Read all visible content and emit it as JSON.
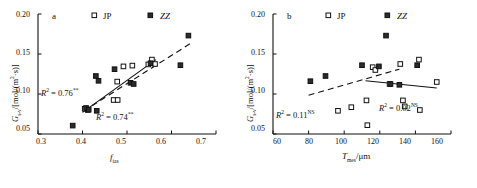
{
  "figure": {
    "background": "#ffffff",
    "ink": "#111111"
  },
  "chart_data": [
    {
      "type": "scatter",
      "panel": "a",
      "title": "",
      "xlabel": "f_ias",
      "ylabel": "G_s-v/[mol/(m2·s)]",
      "xlim": [
        0.3,
        0.7
      ],
      "ylim": [
        0.05,
        0.2
      ],
      "xticks": [
        0.3,
        0.4,
        0.5,
        0.6,
        0.7
      ],
      "xtick_labels": [
        "0.3",
        "0.4",
        "0.5",
        "0.6",
        "0.7"
      ],
      "yticks": [
        0.05,
        0.1,
        0.15,
        0.2
      ],
      "ytick_labels": [
        "0.05",
        "0.10",
        "0.15",
        "0.20"
      ],
      "grid": false,
      "legend_position": "top",
      "series": [
        {
          "name": "JP",
          "marker": "open-square",
          "points": [
            [
              0.405,
              0.0815
            ],
            [
              0.412,
              0.08
            ],
            [
              0.47,
              0.0925
            ],
            [
              0.479,
              0.0925
            ],
            [
              0.478,
              0.1155
            ],
            [
              0.492,
              0.1345
            ],
            [
              0.512,
              0.1355
            ],
            [
              0.548,
              0.137
            ],
            [
              0.556,
              0.143
            ],
            [
              0.563,
              0.1375
            ]
          ]
        },
        {
          "name": "ZZ",
          "marker": "filled-square",
          "points": [
            [
              0.378,
              0.0605
            ],
            [
              0.408,
              0.0825
            ],
            [
              0.414,
              0.0805
            ],
            [
              0.432,
              0.079
            ],
            [
              0.43,
              0.1225
            ],
            [
              0.436,
              0.1165
            ],
            [
              0.472,
              0.131
            ],
            [
              0.508,
              0.114
            ],
            [
              0.515,
              0.1125
            ],
            [
              0.553,
              0.1385
            ],
            [
              0.62,
              0.136
            ],
            [
              0.638,
              0.173
            ]
          ]
        }
      ],
      "fits": [
        {
          "name": "JP-fit",
          "style": "solid",
          "label": "R2 = 0.74**",
          "x": [
            0.4,
            0.565
          ],
          "y": [
            0.077,
            0.143
          ]
        },
        {
          "name": "ZZ-fit",
          "style": "dashed",
          "label": "R2 = 0.76**",
          "x": [
            0.402,
            0.645
          ],
          "y": [
            0.0785,
            0.164
          ]
        }
      ],
      "annotations": [
        {
          "text": "R2 = 0.76**",
          "x": 0.405,
          "y": 0.108
        },
        {
          "text": "R2 = 0.74**",
          "x": 0.48,
          "y": 0.0745
        }
      ]
    },
    {
      "type": "scatter",
      "panel": "b",
      "title": "",
      "xlabel": "T_mes/um",
      "ylabel": "G_s-v/[mol/(m2·s)]",
      "xlim": [
        60,
        160
      ],
      "ylim": [
        0.05,
        0.2
      ],
      "xticks": [
        60,
        80,
        100,
        120,
        140,
        160
      ],
      "xtick_labels": [
        "60",
        "80",
        "100",
        "120",
        "140",
        "160"
      ],
      "yticks": [
        0.05,
        0.1,
        0.15,
        0.2
      ],
      "ytick_labels": [
        "0.05",
        "0.10",
        "0.15",
        "0.20"
      ],
      "grid": false,
      "legend_position": "top",
      "series": [
        {
          "name": "JP",
          "marker": "open-square",
          "points": [
            [
              96.5,
              0.079
            ],
            [
              104.0,
              0.0835
            ],
            [
              112.5,
              0.092
            ],
            [
              113.0,
              0.061
            ],
            [
              116.0,
              0.1335
            ],
            [
              117.5,
              0.13
            ],
            [
              125.5,
              0.1125
            ],
            [
              131.5,
              0.1375
            ],
            [
              133.0,
              0.092
            ],
            [
              134.0,
              0.0845
            ],
            [
              142.0,
              0.143
            ],
            [
              142.5,
              0.08
            ],
            [
              152.0,
              0.115
            ]
          ]
        },
        {
          "name": "ZZ",
          "marker": "filled-square",
          "points": [
            [
              81.0,
              0.116
            ],
            [
              89.5,
              0.1225
            ],
            [
              110.0,
              0.136
            ],
            [
              119.5,
              0.1345
            ],
            [
              123.5,
              0.173
            ],
            [
              126.0,
              0.1125
            ],
            [
              131.0,
              0.1115
            ],
            [
              141.0,
              0.136
            ]
          ]
        }
      ],
      "fits": [
        {
          "name": "ZZ-fit",
          "style": "dashed",
          "label": "R2 = 0.11NS",
          "x": [
            80.0,
            131.0
          ],
          "y": [
            0.0985,
            0.131
          ]
        },
        {
          "name": "JP-fit",
          "style": "solid",
          "label": "R2 = 0.02NS",
          "x": [
            112.0,
            152.0
          ],
          "y": [
            0.1165,
            0.1075
          ]
        }
      ],
      "annotations": [
        {
          "text": "R2 = 0.11NS",
          "x": 82.0,
          "y": 0.0925
        },
        {
          "text": "R2 = 0.02NS",
          "x": 128.0,
          "y": 0.0985
        }
      ]
    }
  ],
  "panel_a": {
    "letter": "a",
    "legend": [
      {
        "label": "JP",
        "marker": "open-square"
      },
      {
        "label": "ZZ",
        "marker": "filled-square"
      }
    ],
    "ytick_labels": [
      "0.20",
      "0.15",
      "0.10",
      "0.05"
    ],
    "xtick_labels": [
      "0.3",
      "0.4",
      "0.5",
      "0.6",
      "0.7"
    ],
    "axis_y": {
      "symbol": "G",
      "sub": "s-v",
      "unit": "/[mol/(m",
      "unit_sup": "2",
      "unit_end": "·s)]"
    },
    "axis_x": {
      "symbol": "f",
      "sub": "ias"
    },
    "r2_upper": {
      "symbol": "R",
      "sup": "2",
      "eq": " = 0.76",
      "stars": "**"
    },
    "r2_lower": {
      "symbol": "R",
      "sup": "2",
      "eq": " = 0.74",
      "stars": "**"
    }
  },
  "panel_b": {
    "letter": "b",
    "legend": [
      {
        "label": "JP",
        "marker": "open-square"
      },
      {
        "label": "ZZ",
        "marker": "filled-square"
      }
    ],
    "ytick_labels": [
      "0.20",
      "0.15",
      "0.10",
      "0.05"
    ],
    "xtick_labels": [
      "60",
      "80",
      "100",
      "120",
      "140",
      "160"
    ],
    "axis_y": {
      "symbol": "G",
      "sub": "s-v",
      "unit": "/[mol/(m",
      "unit_sup": "2",
      "unit_end": "·s)]"
    },
    "axis_x": {
      "symbol": "T",
      "sub": "mes",
      "unit": "/μm"
    },
    "r2_left": {
      "symbol": "R",
      "sup": "2",
      "eq": " = 0.11",
      "stars": "NS"
    },
    "r2_right": {
      "symbol": "R",
      "sup": "2",
      "eq": " = 0.02",
      "stars": "NS"
    }
  }
}
